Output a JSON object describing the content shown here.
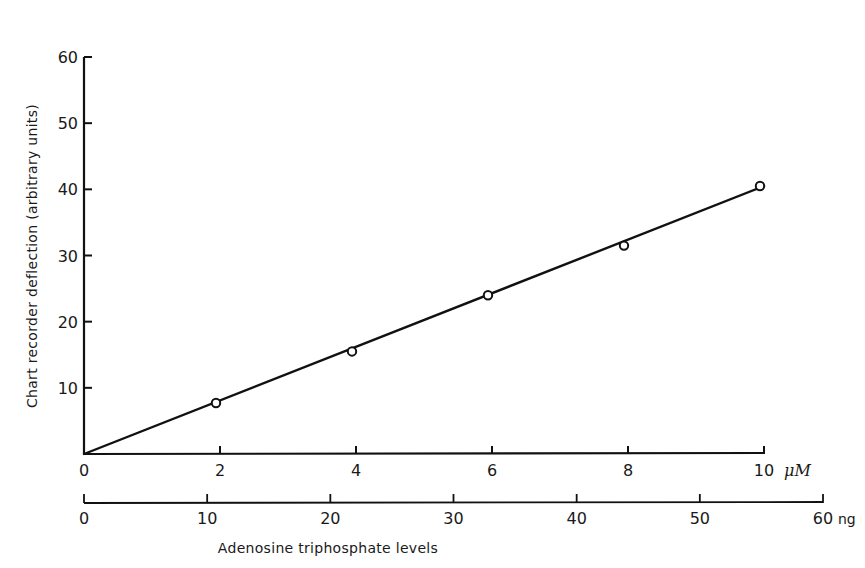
{
  "chart_data": {
    "type": "scatter",
    "title": "",
    "xlabel": "Adenosine triphosphate levels",
    "ylabel": "Chart recorder deflection (arbitrary units)",
    "x_primary": {
      "unit": "μM",
      "range": [
        0,
        10
      ],
      "ticks": [
        0,
        2,
        4,
        6,
        8,
        10
      ],
      "tick_labels": [
        "0",
        "2",
        "4",
        "6",
        "8",
        "10"
      ]
    },
    "x_secondary": {
      "unit": "ng",
      "range": [
        0,
        60
      ],
      "ticks": [
        0,
        10,
        20,
        30,
        40,
        50,
        60
      ],
      "tick_labels": [
        "0",
        "10",
        "20",
        "30",
        "40",
        "50",
        "60"
      ]
    },
    "y_axis": {
      "range": [
        0,
        60
      ],
      "ticks": [
        10,
        20,
        30,
        40,
        50,
        60
      ],
      "tick_labels": [
        "10",
        "20",
        "30",
        "40",
        "50",
        "60"
      ]
    },
    "series": [
      {
        "name": "ATP calibration",
        "marker": "open-circle",
        "x": [
          2,
          4,
          6,
          8,
          10
        ],
        "y": [
          7.7,
          15.5,
          24.0,
          31.5,
          40.5
        ]
      }
    ],
    "fit_line": {
      "x": [
        0,
        10
      ],
      "y": [
        0,
        40.5
      ],
      "type": "linear"
    },
    "grid": false,
    "legend": null
  },
  "labels": {
    "origin": "0",
    "x_primary_unit": "μM",
    "x_secondary_unit": "ng",
    "xlabel": "Adenosine triphosphate levels",
    "ylabel": "Chart recorder deflection (arbitrary units)"
  }
}
